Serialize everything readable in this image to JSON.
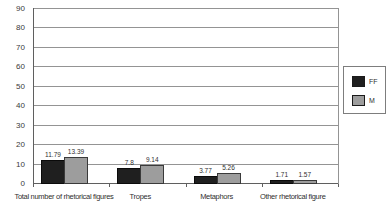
{
  "chart_data": {
    "type": "bar",
    "categories": [
      "Total number of rhetorical figures",
      "Tropes",
      "Metaphors",
      "Other rhetorical figure"
    ],
    "series": [
      {
        "name": "FF",
        "color": "#1f1f1f",
        "border_color": "#0a0a0a",
        "values": [
          11.79,
          7.8,
          3.77,
          1.71
        ],
        "value_labels": [
          "11.79",
          "7.8",
          "3.77",
          "1.71"
        ]
      },
      {
        "name": "M",
        "color": "#9d9d9d",
        "border_color": "#3a3a3a",
        "values": [
          13.39,
          9.14,
          5.26,
          1.57
        ],
        "value_labels": [
          "13.39",
          "9.14",
          "5.26",
          "1.57"
        ]
      }
    ],
    "ylim": [
      0,
      90
    ],
    "yticks": [
      0,
      10,
      20,
      30,
      40,
      50,
      60,
      70,
      80,
      90
    ],
    "grid": true,
    "legend": {
      "position": "right"
    },
    "colors": {
      "grid_line": "#949494",
      "axis_line": "#5f5f5f",
      "text": "#2f2f2f",
      "background": "#ffffff"
    }
  }
}
